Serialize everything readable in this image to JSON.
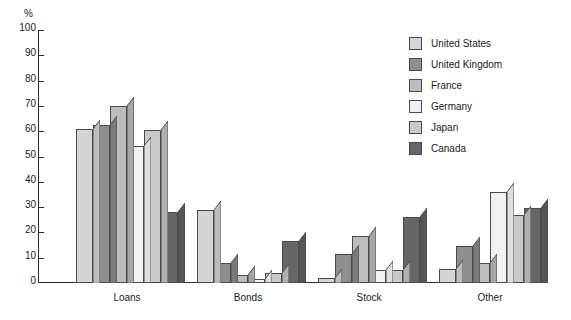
{
  "chart_data": {
    "type": "bar",
    "title": "",
    "subtitle": "",
    "xlabel": "",
    "ylabel": "%",
    "ylim": [
      0,
      100
    ],
    "ytick_step": 10,
    "yticks": [
      100,
      90,
      80,
      70,
      60,
      50,
      40,
      30,
      20,
      10,
      0
    ],
    "grid": false,
    "legend_position": "top-right",
    "style": "3d-grouped-bar-grayscale",
    "categories": [
      "Loans",
      "Bonds",
      "Stock",
      "Other"
    ],
    "series": [
      {
        "name": "United States",
        "color": "#d5d5d5",
        "side_color": "#bdbdbd",
        "values": [
          61,
          29,
          2,
          5.5
        ]
      },
      {
        "name": "United Kingdom",
        "color": "#8e8e8e",
        "side_color": "#7a7a7a",
        "values": [
          62.5,
          8,
          11.5,
          14.5
        ]
      },
      {
        "name": "France",
        "color": "#bdbdbd",
        "side_color": "#a6a6a6",
        "values": [
          70,
          3,
          18.5,
          8
        ]
      },
      {
        "name": "Germany",
        "color": "#f2f2f2",
        "side_color": "#dedede",
        "values": [
          54,
          1.5,
          5,
          36
        ]
      },
      {
        "name": "Japan",
        "color": "#c9c9c9",
        "side_color": "#b0b0b0",
        "values": [
          60.5,
          4,
          5,
          27
        ]
      },
      {
        "name": "Canada",
        "color": "#666666",
        "side_color": "#565656",
        "values": [
          28,
          16.5,
          26,
          29.5
        ]
      }
    ]
  },
  "axis": {
    "unit_label": "%"
  },
  "legend": {
    "items": [
      {
        "label": "United States"
      },
      {
        "label": "United Kingdom"
      },
      {
        "label": "France"
      },
      {
        "label": "Germany"
      },
      {
        "label": "Japan"
      },
      {
        "label": "Canada"
      }
    ]
  }
}
